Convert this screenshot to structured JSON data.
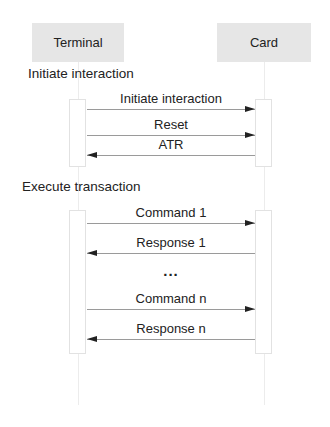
{
  "diagram": {
    "type": "sequence",
    "actors": [
      {
        "id": "terminal",
        "label": "Terminal"
      },
      {
        "id": "card",
        "label": "Card"
      }
    ],
    "sections": [
      {
        "label": "Initiate interaction",
        "messages": [
          {
            "label": "Initiate interaction",
            "from": "terminal",
            "to": "card"
          },
          {
            "label": "Reset",
            "from": "terminal",
            "to": "card"
          },
          {
            "label": "ATR",
            "from": "card",
            "to": "terminal"
          }
        ]
      },
      {
        "label": "Execute transaction",
        "messages": [
          {
            "label": "Command 1",
            "from": "terminal",
            "to": "card"
          },
          {
            "label": "Response 1",
            "from": "card",
            "to": "terminal"
          },
          {
            "label": "Command n",
            "from": "terminal",
            "to": "card"
          },
          {
            "label": "Response n",
            "from": "card",
            "to": "terminal"
          }
        ],
        "ellipsis": "..."
      }
    ],
    "colors": {
      "actor_fill": "#e6e6e6",
      "arrow": "#222222",
      "line": "#9a9a9a"
    }
  }
}
